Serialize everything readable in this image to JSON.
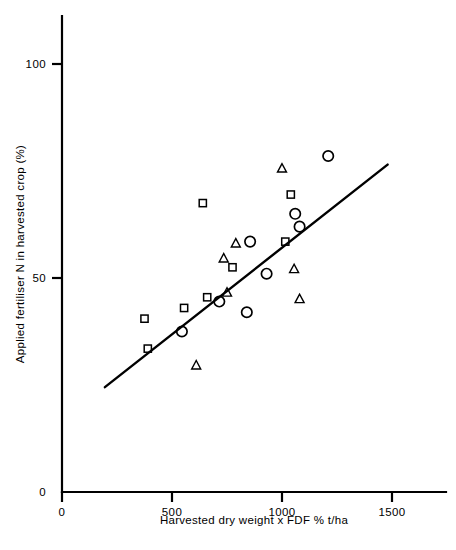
{
  "chart_data": {
    "type": "scatter",
    "title": "",
    "xlabel": "Harvested dry weight x FDF % t/ha",
    "ylabel": "Applied fertiliser N in harvested crop (%)",
    "xlim": [
      0,
      1560
    ],
    "ylim": [
      0,
      112
    ],
    "xticks": [
      0,
      500,
      1000,
      1500
    ],
    "xtick_labels": [
      "0",
      "500",
      "1000",
      "1500"
    ],
    "yticks": [
      0,
      50,
      100
    ],
    "ytick_labels": [
      "0",
      "50",
      "100"
    ],
    "grid": false,
    "legend": "none",
    "marker_color": "#000000",
    "line_color": "#000000",
    "series": [
      {
        "name": "square",
        "marker": "square",
        "points": [
          {
            "x": 375,
            "y": 40.5
          },
          {
            "x": 390,
            "y": 33.5
          },
          {
            "x": 555,
            "y": 43.0
          },
          {
            "x": 640,
            "y": 67.5
          },
          {
            "x": 660,
            "y": 45.5
          },
          {
            "x": 775,
            "y": 52.5
          },
          {
            "x": 1015,
            "y": 58.5
          },
          {
            "x": 1040,
            "y": 69.5
          }
        ]
      },
      {
        "name": "triangle",
        "marker": "triangle",
        "points": [
          {
            "x": 610,
            "y": 29.5
          },
          {
            "x": 735,
            "y": 54.5
          },
          {
            "x": 750,
            "y": 46.5
          },
          {
            "x": 790,
            "y": 58.0
          },
          {
            "x": 1000,
            "y": 75.5
          },
          {
            "x": 1055,
            "y": 52.0
          },
          {
            "x": 1080,
            "y": 45.0
          }
        ]
      },
      {
        "name": "circle",
        "marker": "circle",
        "points": [
          {
            "x": 545,
            "y": 37.5
          },
          {
            "x": 715,
            "y": 44.5
          },
          {
            "x": 840,
            "y": 42.0
          },
          {
            "x": 855,
            "y": 58.5
          },
          {
            "x": 930,
            "y": 51.0
          },
          {
            "x": 1060,
            "y": 65.0
          },
          {
            "x": 1080,
            "y": 62.0
          },
          {
            "x": 1210,
            "y": 78.5
          }
        ]
      }
    ],
    "fit_line": {
      "x1": 195,
      "y1": 24.5,
      "x2": 1480,
      "y2": 76.5
    }
  }
}
